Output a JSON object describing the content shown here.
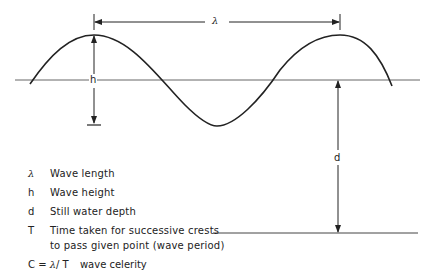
{
  "diagram": {
    "labels": {
      "lambda": "λ",
      "h": "h",
      "d": "d"
    },
    "colors": {
      "stroke": "#222222",
      "water_line": "#555555"
    }
  },
  "legend": {
    "items": [
      {
        "symbol": "λ",
        "text": "Wave length"
      },
      {
        "symbol": "h",
        "text": "Wave height"
      },
      {
        "symbol": "d",
        "text": "Still water depth"
      },
      {
        "symbol": "T",
        "text": "Time taken for successive crests",
        "text2": "to pass given point (wave period)"
      }
    ],
    "formula": {
      "lhs": "C = ",
      "lambda": "λ",
      "rhs": "/ T",
      "text": "wave celerity"
    }
  }
}
